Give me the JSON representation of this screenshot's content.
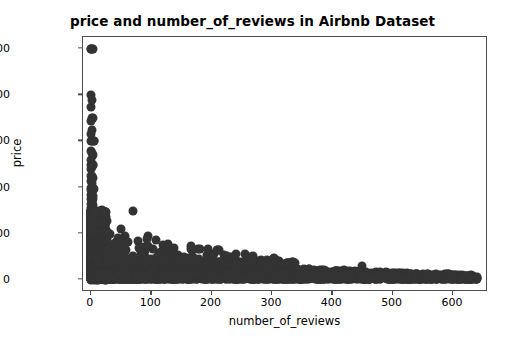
{
  "chart_data": {
    "type": "scatter",
    "title": "price and number_of_reviews in Airbnb Dataset",
    "xlabel": "number_of_reviews",
    "ylabel": "price",
    "xlim": [
      -13,
      658
    ],
    "ylim": [
      -520,
      10520
    ],
    "xticks": [
      0,
      100,
      200,
      300,
      400,
      500,
      600
    ],
    "yticks": [
      0,
      2000,
      4000,
      6000,
      8000,
      10000
    ],
    "xtick_labels": [
      "0",
      "100",
      "200",
      "300",
      "400",
      "500",
      "600"
    ],
    "ytick_labels": [
      "0",
      "2000",
      "4000",
      "6000",
      "8000",
      "10000"
    ],
    "grid": false,
    "legend": null,
    "marker_color": "#333333",
    "marker_size": 9,
    "series": [
      {
        "name": "listings",
        "points": [
          [
            1,
            10000
          ],
          [
            2,
            10000
          ],
          [
            3,
            10000
          ],
          [
            0,
            10000
          ],
          [
            1,
            8000
          ],
          [
            2,
            7800
          ],
          [
            1,
            7500
          ],
          [
            2,
            7000
          ],
          [
            3,
            7000
          ],
          [
            1,
            6900
          ],
          [
            2,
            6500
          ],
          [
            1,
            6300
          ],
          [
            1,
            6000
          ],
          [
            2,
            6000
          ],
          [
            5,
            6000
          ],
          [
            6,
            6000
          ],
          [
            1,
            5600
          ],
          [
            2,
            5500
          ],
          [
            3,
            5400
          ],
          [
            1,
            5200
          ],
          [
            1,
            5000
          ],
          [
            2,
            5000
          ],
          [
            3,
            5000
          ],
          [
            4,
            5000
          ],
          [
            2,
            4900
          ],
          [
            1,
            4800
          ],
          [
            1,
            4500
          ],
          [
            2,
            4500
          ],
          [
            3,
            4400
          ],
          [
            1,
            4300
          ],
          [
            2,
            4200
          ],
          [
            1,
            4000
          ],
          [
            2,
            4000
          ],
          [
            3,
            4000
          ],
          [
            4,
            4000
          ],
          [
            5,
            3950
          ],
          [
            1,
            3900
          ],
          [
            2,
            3800
          ],
          [
            1,
            3700
          ],
          [
            3,
            3650
          ],
          [
            2,
            3600
          ],
          [
            1,
            3500
          ],
          [
            4,
            3500
          ],
          [
            2,
            3400
          ],
          [
            1,
            3300
          ],
          [
            3,
            3250
          ],
          [
            2,
            3200
          ],
          [
            1,
            3100
          ],
          [
            1,
            3000
          ],
          [
            2,
            3000
          ],
          [
            3,
            3000
          ],
          [
            4,
            3000
          ],
          [
            5,
            3000
          ],
          [
            70,
            3000
          ],
          [
            1,
            2900
          ],
          [
            2,
            2850
          ],
          [
            3,
            2800
          ],
          [
            1,
            2750
          ],
          [
            4,
            2700
          ],
          [
            2,
            2650
          ],
          [
            1,
            2600
          ],
          [
            5,
            2550
          ],
          [
            3,
            2500
          ],
          [
            2,
            2500
          ],
          [
            1,
            2500
          ],
          [
            6,
            2480
          ],
          [
            1,
            2400
          ],
          [
            2,
            2380
          ],
          [
            4,
            2350
          ],
          [
            3,
            2300
          ],
          [
            2,
            2250
          ],
          [
            50,
            2200
          ],
          [
            1,
            2200
          ],
          [
            5,
            2150
          ],
          [
            2,
            2100
          ],
          [
            3,
            2050
          ],
          [
            1,
            2000
          ],
          [
            2,
            2000
          ],
          [
            4,
            2000
          ],
          [
            6,
            2000
          ],
          [
            8,
            2000
          ],
          [
            10,
            1980
          ],
          [
            1,
            1950
          ],
          [
            3,
            1900
          ],
          [
            95,
            1900
          ],
          [
            2,
            1880
          ],
          [
            5,
            1850
          ],
          [
            1,
            1800
          ],
          [
            4,
            1780
          ],
          [
            78,
            1700
          ],
          [
            2,
            1750
          ],
          [
            7,
            1700
          ],
          [
            3,
            1650
          ],
          [
            1,
            1600
          ],
          [
            9,
            1600
          ],
          [
            2,
            1580
          ],
          [
            12,
            1550
          ],
          [
            120,
            1500
          ],
          [
            1,
            1500
          ],
          [
            3,
            1500
          ],
          [
            5,
            1500
          ],
          [
            7,
            1480
          ],
          [
            2,
            1450
          ],
          [
            15,
            1420
          ],
          [
            4,
            1400
          ],
          [
            1,
            1400
          ],
          [
            6,
            1380
          ],
          [
            10,
            1350
          ],
          [
            2,
            1300
          ],
          [
            8,
            1300
          ],
          [
            18,
            1280
          ],
          [
            3,
            1250
          ],
          [
            1,
            1200
          ],
          [
            5,
            1200
          ],
          [
            12,
            1180
          ],
          [
            22,
            1150
          ],
          [
            7,
            1120
          ],
          [
            2,
            1100
          ],
          [
            16,
            1080
          ],
          [
            4,
            1050
          ],
          [
            1,
            1000
          ],
          [
            3,
            1000
          ],
          [
            6,
            1000
          ],
          [
            9,
            1000
          ],
          [
            14,
            1000
          ],
          [
            20,
            980
          ],
          [
            28,
            960
          ],
          [
            35,
            950
          ],
          [
            45,
            930
          ],
          [
            60,
            900
          ],
          [
            80,
            880
          ],
          [
            110,
            850
          ],
          [
            150,
            800
          ],
          [
            2,
            950
          ],
          [
            5,
            900
          ],
          [
            8,
            880
          ],
          [
            11,
            850
          ],
          [
            17,
            820
          ],
          [
            25,
            800
          ],
          [
            33,
            780
          ],
          [
            42,
            760
          ],
          [
            55,
            740
          ],
          [
            68,
            720
          ],
          [
            88,
            700
          ],
          [
            100,
            690
          ],
          [
            130,
            670
          ],
          [
            170,
            650
          ],
          [
            200,
            620
          ],
          [
            240,
            600
          ],
          [
            1,
            850
          ],
          [
            3,
            800
          ],
          [
            6,
            780
          ],
          [
            10,
            760
          ],
          [
            15,
            740
          ],
          [
            21,
            720
          ],
          [
            30,
            700
          ],
          [
            38,
            680
          ],
          [
            48,
            660
          ],
          [
            62,
            640
          ],
          [
            75,
            620
          ],
          [
            92,
            600
          ],
          [
            115,
            580
          ],
          [
            140,
            560
          ],
          [
            180,
            540
          ],
          [
            220,
            520
          ],
          [
            260,
            500
          ],
          [
            300,
            480
          ],
          [
            340,
            460
          ],
          [
            380,
            450
          ],
          [
            420,
            440
          ],
          [
            450,
            600
          ],
          [
            1,
            600
          ],
          [
            2,
            580
          ],
          [
            4,
            560
          ],
          [
            7,
            550
          ],
          [
            12,
            540
          ],
          [
            18,
            530
          ],
          [
            24,
            520
          ],
          [
            32,
            510
          ],
          [
            40,
            500
          ],
          [
            52,
            490
          ],
          [
            65,
            480
          ],
          [
            82,
            470
          ],
          [
            98,
            460
          ],
          [
            125,
            450
          ],
          [
            160,
            440
          ],
          [
            190,
            430
          ],
          [
            230,
            420
          ],
          [
            270,
            410
          ],
          [
            310,
            400
          ],
          [
            350,
            390
          ],
          [
            390,
            380
          ],
          [
            430,
            370
          ],
          [
            470,
            300
          ],
          [
            500,
            260
          ],
          [
            530,
            240
          ],
          [
            560,
            230
          ],
          [
            585,
            220
          ],
          [
            600,
            215
          ],
          [
            615,
            210
          ],
          [
            630,
            200
          ],
          [
            1,
            400
          ],
          [
            3,
            390
          ],
          [
            5,
            380
          ],
          [
            9,
            370
          ],
          [
            13,
            360
          ],
          [
            19,
            350
          ],
          [
            26,
            345
          ],
          [
            34,
            340
          ],
          [
            44,
            335
          ],
          [
            58,
            330
          ],
          [
            72,
            325
          ],
          [
            90,
            320
          ],
          [
            105,
            315
          ],
          [
            135,
            310
          ],
          [
            165,
            305
          ],
          [
            195,
            300
          ],
          [
            235,
            295
          ],
          [
            275,
            290
          ],
          [
            315,
            285
          ],
          [
            355,
            280
          ],
          [
            395,
            275
          ],
          [
            435,
            270
          ],
          [
            1,
            200
          ],
          [
            4,
            195
          ],
          [
            8,
            190
          ],
          [
            14,
            185
          ],
          [
            20,
            180
          ],
          [
            27,
            175
          ],
          [
            36,
            170
          ],
          [
            46,
            168
          ],
          [
            56,
            165
          ],
          [
            70,
            162
          ],
          [
            85,
            160
          ],
          [
            102,
            158
          ],
          [
            118,
            155
          ],
          [
            145,
            152
          ],
          [
            175,
            150
          ],
          [
            205,
            148
          ],
          [
            245,
            145
          ],
          [
            285,
            142
          ],
          [
            325,
            140
          ],
          [
            365,
            138
          ],
          [
            405,
            136
          ],
          [
            445,
            134
          ],
          [
            1,
            100
          ],
          [
            5,
            98
          ],
          [
            10,
            96
          ],
          [
            16,
            94
          ],
          [
            23,
            92
          ],
          [
            31,
            90
          ],
          [
            41,
            88
          ],
          [
            53,
            86
          ],
          [
            66,
            84
          ],
          [
            79,
            82
          ],
          [
            95,
            80
          ],
          [
            112,
            78
          ],
          [
            128,
            76
          ],
          [
            155,
            74
          ],
          [
            185,
            72
          ],
          [
            215,
            70
          ],
          [
            255,
            68
          ],
          [
            295,
            66
          ],
          [
            335,
            64
          ],
          [
            375,
            62
          ],
          [
            415,
            60
          ],
          [
            455,
            58
          ]
        ]
      }
    ]
  }
}
